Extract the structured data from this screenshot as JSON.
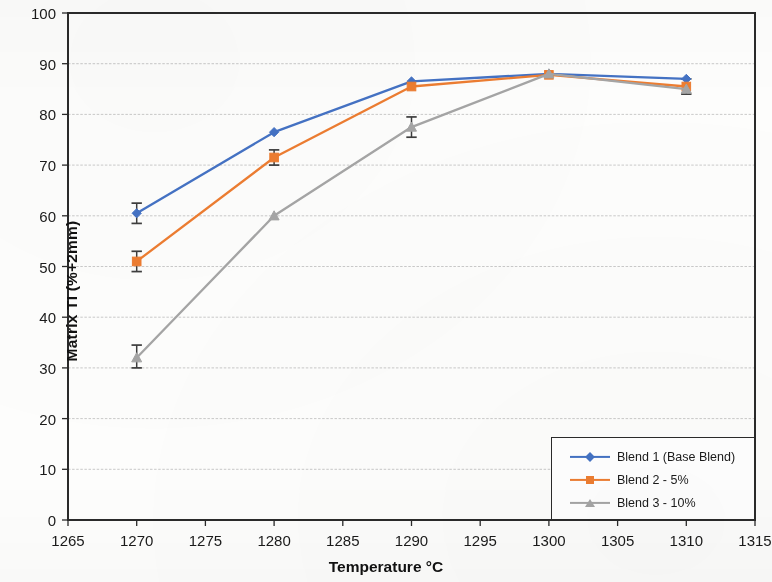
{
  "chart_data": {
    "type": "line",
    "title": "",
    "subtitle": "",
    "xlabel": "Temperature °C",
    "ylabel": "Matrix TI (%+2mm)",
    "x": [
      1270,
      1280,
      1290,
      1300,
      1310
    ],
    "xlim": [
      1265,
      1315
    ],
    "ylim": [
      0,
      100
    ],
    "x_ticks": [
      1265,
      1270,
      1275,
      1280,
      1285,
      1290,
      1295,
      1300,
      1305,
      1310,
      1315
    ],
    "y_ticks": [
      0,
      10,
      20,
      30,
      40,
      50,
      60,
      70,
      80,
      90,
      100
    ],
    "x_tick_labels": [
      "1265",
      "1270",
      "1275",
      "1280",
      "1285",
      "1290",
      "1295",
      "1300",
      "1305",
      "1310",
      "1315"
    ],
    "y_tick_labels": [
      "0",
      "10",
      "20",
      "30",
      "40",
      "50",
      "60",
      "70",
      "80",
      "90",
      "100"
    ],
    "grid": "horizontal",
    "legend_position": "bottom-right",
    "series": [
      {
        "name": "Blend 1 (Base Blend)",
        "color": "#4472C4",
        "marker": "diamond",
        "values": [
          60.5,
          76.5,
          86.5,
          88.0,
          87.0
        ],
        "error_low": [
          58.5,
          76.5,
          86.5,
          88.0,
          87.0
        ],
        "error_high": [
          62.5,
          76.5,
          86.5,
          88.0,
          87.0
        ]
      },
      {
        "name": "Blend 2 - 5%",
        "color": "#ED7D31",
        "marker": "square",
        "values": [
          51.0,
          71.5,
          85.5,
          87.8,
          85.5
        ],
        "error_low": [
          49.0,
          70.0,
          85.5,
          87.8,
          84.0
        ],
        "error_high": [
          53.0,
          73.0,
          85.5,
          87.8,
          87.0
        ]
      },
      {
        "name": "Blend 3 - 10%",
        "color": "#A5A5A5",
        "marker": "triangle",
        "values": [
          32.0,
          60.0,
          77.5,
          88.0,
          85.0
        ],
        "error_low": [
          30.0,
          60.0,
          75.5,
          88.0,
          85.0
        ],
        "error_high": [
          34.5,
          60.0,
          79.5,
          88.0,
          85.0
        ]
      }
    ]
  },
  "axes": {
    "y_title": "Matrix TI (%+2mm)",
    "x_title": "Temperature °C"
  },
  "legend": {
    "entries": [
      {
        "label": "Blend 1 (Base Blend)",
        "color": "#4472C4",
        "marker": "diamond"
      },
      {
        "label": "Blend 2 - 5%",
        "color": "#ED7D31",
        "marker": "square"
      },
      {
        "label": "Blend 3 - 10%",
        "color": "#A5A5A5",
        "marker": "triangle"
      }
    ]
  },
  "style": {
    "axis_color": "#2a2a2a",
    "grid_color": "#b9b9b9",
    "error_bar_color": "#3d3d3d",
    "background": "#fdfdfc",
    "text_color": "#1a1a1a"
  }
}
